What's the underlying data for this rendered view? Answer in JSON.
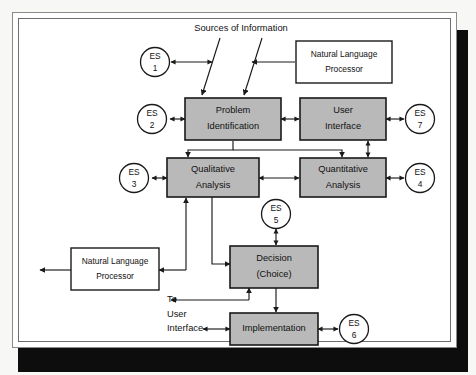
{
  "diagram": {
    "fill_color": "#b9b9b9",
    "line_color": "#1a1a1a",
    "labels": {
      "sources_of_information": "Sources of Information",
      "to": "To",
      "user": "User",
      "interface": "Interface"
    },
    "boxes": [
      {
        "id": "nlp_top",
        "style": "white",
        "line1": "Natural Language",
        "line2": "Processor"
      },
      {
        "id": "problem_identification",
        "style": "gray",
        "line1": "Problem",
        "line2": "Identification"
      },
      {
        "id": "user_interface",
        "style": "gray",
        "line1": "User",
        "line2": "Interface"
      },
      {
        "id": "qualitative_analysis",
        "style": "gray",
        "line1": "Qualitative",
        "line2": "Analysis"
      },
      {
        "id": "quantitative_analysis",
        "style": "gray",
        "line1": "Quantitative",
        "line2": "Analysis"
      },
      {
        "id": "nlp_bottom",
        "style": "white",
        "line1": "Natural Language",
        "line2": "Processor"
      },
      {
        "id": "decision",
        "style": "gray",
        "line1": "Decision",
        "line2": "(Choice)"
      },
      {
        "id": "implementation",
        "style": "gray",
        "line1": "Implementation",
        "line2": ""
      }
    ],
    "expert_systems": [
      {
        "id": "es1",
        "top": "ES",
        "num": "1"
      },
      {
        "id": "es2",
        "top": "ES",
        "num": "2"
      },
      {
        "id": "es3",
        "top": "ES",
        "num": "3"
      },
      {
        "id": "es4",
        "top": "ES",
        "num": "4"
      },
      {
        "id": "es5",
        "top": "ES",
        "num": "5"
      },
      {
        "id": "es6",
        "top": "ES",
        "num": "6"
      },
      {
        "id": "es7",
        "top": "ES",
        "num": "7"
      }
    ]
  }
}
